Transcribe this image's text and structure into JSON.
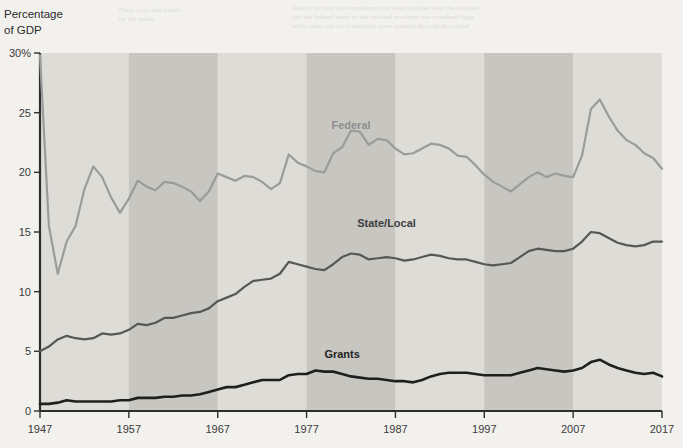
{
  "figure": {
    "y_axis_title_line1": "Percentage",
    "y_axis_title_line2": "of GDP"
  },
  "chart_data": {
    "type": "line",
    "title": "",
    "xlabel": "",
    "ylabel": "Percentage of GDP",
    "xlim": [
      1947,
      2017
    ],
    "ylim": [
      0,
      30
    ],
    "grid": false,
    "legend_position": "inline-annotations",
    "xticks": [
      "1947",
      "1957",
      "1967",
      "1977",
      "1987",
      "1997",
      "2007",
      "2017"
    ],
    "xtick_values": [
      1947,
      1957,
      1967,
      1977,
      1987,
      1997,
      2007,
      2017
    ],
    "yticks": [
      "0",
      "5",
      "10",
      "15",
      "20",
      "25",
      "30%"
    ],
    "ytick_values": [
      0,
      5,
      10,
      15,
      20,
      25,
      30
    ],
    "band_shading": {
      "description": "alternating decade bands",
      "light": "#dedcd7",
      "dark": "#c8c6c1",
      "bands": [
        {
          "start": 1947,
          "end": 1957,
          "tone": "light"
        },
        {
          "start": 1957,
          "end": 1967,
          "tone": "dark"
        },
        {
          "start": 1967,
          "end": 1977,
          "tone": "light"
        },
        {
          "start": 1977,
          "end": 1987,
          "tone": "dark"
        },
        {
          "start": 1987,
          "end": 1997,
          "tone": "light"
        },
        {
          "start": 1997,
          "end": 2007,
          "tone": "dark"
        },
        {
          "start": 2007,
          "end": 2017,
          "tone": "light"
        }
      ]
    },
    "x": [
      1947,
      1948,
      1949,
      1950,
      1951,
      1952,
      1953,
      1954,
      1955,
      1956,
      1957,
      1958,
      1959,
      1960,
      1961,
      1962,
      1963,
      1964,
      1965,
      1966,
      1967,
      1968,
      1969,
      1970,
      1971,
      1972,
      1973,
      1974,
      1975,
      1976,
      1977,
      1978,
      1979,
      1980,
      1981,
      1982,
      1983,
      1984,
      1985,
      1986,
      1987,
      1988,
      1989,
      1990,
      1991,
      1992,
      1993,
      1994,
      1995,
      1996,
      1997,
      1998,
      1999,
      2000,
      2001,
      2002,
      2003,
      2004,
      2005,
      2006,
      2007,
      2008,
      2009,
      2010,
      2011,
      2012,
      2013,
      2014,
      2015,
      2016,
      2017
    ],
    "series": [
      {
        "name": "Federal",
        "color": "#9b9b9b",
        "label_x": 1982,
        "label_y": 23.6,
        "values": [
          29.8,
          15.5,
          11.5,
          14.2,
          15.5,
          18.6,
          20.5,
          19.6,
          17.9,
          16.6,
          17.8,
          19.3,
          18.8,
          18.5,
          19.2,
          19.1,
          18.8,
          18.4,
          17.6,
          18.4,
          19.9,
          19.6,
          19.3,
          19.7,
          19.6,
          19.2,
          18.6,
          19.1,
          21.5,
          20.8,
          20.5,
          20.1,
          20.0,
          21.6,
          22.1,
          23.5,
          23.4,
          22.3,
          22.8,
          22.7,
          22.0,
          21.5,
          21.6,
          22.0,
          22.4,
          22.3,
          22.0,
          21.4,
          21.3,
          20.6,
          19.8,
          19.2,
          18.8,
          18.4,
          19.0,
          19.6,
          20.0,
          19.6,
          19.9,
          19.7,
          19.6,
          21.4,
          25.3,
          26.1,
          24.7,
          23.5,
          22.7,
          22.3,
          21.6,
          21.2,
          20.3
        ]
      },
      {
        "name": "State/Local",
        "color": "#575757",
        "label_x": 1986,
        "label_y": 15.4,
        "values": [
          5.0,
          5.4,
          6.0,
          6.3,
          6.1,
          6.0,
          6.1,
          6.5,
          6.4,
          6.5,
          6.8,
          7.3,
          7.2,
          7.4,
          7.8,
          7.8,
          8.0,
          8.2,
          8.3,
          8.6,
          9.2,
          9.5,
          9.8,
          10.4,
          10.9,
          11.0,
          11.1,
          11.5,
          12.5,
          12.3,
          12.1,
          11.9,
          11.8,
          12.3,
          12.9,
          13.2,
          13.1,
          12.7,
          12.8,
          12.9,
          12.8,
          12.6,
          12.7,
          12.9,
          13.1,
          13.0,
          12.8,
          12.7,
          12.7,
          12.5,
          12.3,
          12.2,
          12.3,
          12.4,
          12.9,
          13.4,
          13.6,
          13.5,
          13.4,
          13.4,
          13.6,
          14.2,
          15.0,
          14.9,
          14.5,
          14.1,
          13.9,
          13.8,
          13.9,
          14.2,
          14.2
        ]
      },
      {
        "name": "Grants",
        "color": "#1f1f1f",
        "label_x": 1981,
        "label_y": 4.4,
        "values": [
          0.6,
          0.6,
          0.7,
          0.9,
          0.8,
          0.8,
          0.8,
          0.8,
          0.8,
          0.9,
          0.9,
          1.1,
          1.1,
          1.1,
          1.2,
          1.2,
          1.3,
          1.3,
          1.4,
          1.6,
          1.8,
          2.0,
          2.0,
          2.2,
          2.4,
          2.6,
          2.6,
          2.6,
          3.0,
          3.1,
          3.1,
          3.4,
          3.3,
          3.3,
          3.1,
          2.9,
          2.8,
          2.7,
          2.7,
          2.6,
          2.5,
          2.5,
          2.4,
          2.6,
          2.9,
          3.1,
          3.2,
          3.2,
          3.2,
          3.1,
          3.0,
          3.0,
          3.0,
          3.0,
          3.2,
          3.4,
          3.6,
          3.5,
          3.4,
          3.3,
          3.4,
          3.6,
          4.1,
          4.3,
          3.9,
          3.6,
          3.4,
          3.2,
          3.1,
          3.2,
          2.9
        ]
      }
    ]
  }
}
